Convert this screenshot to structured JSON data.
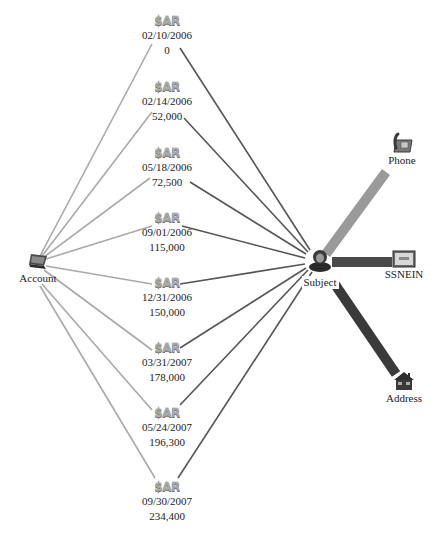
{
  "diagram": {
    "type": "link-analysis",
    "colors": {
      "account_edge": "#a9a9a9",
      "subject_edge": "#555555",
      "phone_edge": "#9a9a9a",
      "ssnein_edge": "#4a4a4a",
      "address_edge": "#3a3a3a"
    },
    "account": {
      "label": "Account",
      "icon": "laptop-icon"
    },
    "subject": {
      "label": "Subject",
      "icon": "person-icon"
    },
    "sar_nodes": [
      {
        "badge": "$AR",
        "date": "02/10/2006",
        "amount": "0"
      },
      {
        "badge": "$AR",
        "date": "02/14/2006",
        "amount": "52,000"
      },
      {
        "badge": "$AR",
        "date": "05/18/2006",
        "amount": "72,500"
      },
      {
        "badge": "$AR",
        "date": "09/01/2006",
        "amount": "115,000"
      },
      {
        "badge": "$AR",
        "date": "12/31/2006",
        "amount": "150,000"
      },
      {
        "badge": "$AR",
        "date": "03/31/2007",
        "amount": "178,000"
      },
      {
        "badge": "$AR",
        "date": "05/24/2007",
        "amount": "196,300"
      },
      {
        "badge": "$AR",
        "date": "09/30/2007",
        "amount": "234,400"
      }
    ],
    "attributes": [
      {
        "label": "Phone",
        "icon": "telephone-icon"
      },
      {
        "label": "SSNEIN",
        "icon": "id-card-icon"
      },
      {
        "label": "Address",
        "icon": "house-icon"
      }
    ]
  }
}
